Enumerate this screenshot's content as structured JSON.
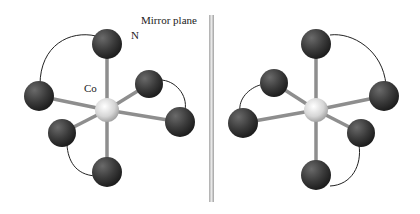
{
  "labels": {
    "mirror": "Mirror plane",
    "nitrogen": "N",
    "cobalt": "Co"
  },
  "colors": {
    "ligand_atom": "#3a3a3a",
    "metal_atom": "#d8d8d8",
    "bond": "#9a9a9a",
    "mirror": "#b0b0b0",
    "chelate_arc": "#222222"
  }
}
